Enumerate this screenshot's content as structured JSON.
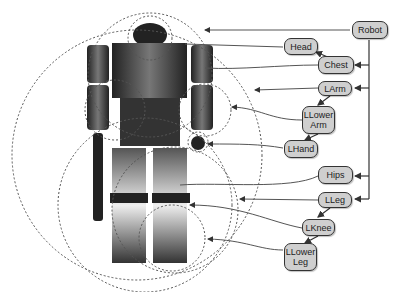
{
  "diagram": {
    "nodes": [
      {
        "id": "robot",
        "label": "Robot"
      },
      {
        "id": "head",
        "label": "Head"
      },
      {
        "id": "chest",
        "label": "Chest"
      },
      {
        "id": "larm",
        "label": "LArm"
      },
      {
        "id": "llowerarm",
        "label": "LLower Arm"
      },
      {
        "id": "lhand",
        "label": "LHand"
      },
      {
        "id": "hips",
        "label": "Hips"
      },
      {
        "id": "lleg",
        "label": "LLeg"
      },
      {
        "id": "lknee",
        "label": "LKnee"
      },
      {
        "id": "llowerleg",
        "label": "LLower Leg"
      }
    ],
    "edges": [
      {
        "from": "robot",
        "to": "chest"
      },
      {
        "from": "robot",
        "to": "larm"
      },
      {
        "from": "robot",
        "to": "hips"
      },
      {
        "from": "robot",
        "to": "lleg"
      },
      {
        "from": "chest",
        "to": "head"
      },
      {
        "from": "larm",
        "to": "llowerarm"
      },
      {
        "from": "llowerarm",
        "to": "lhand"
      },
      {
        "from": "lleg",
        "to": "lknee"
      },
      {
        "from": "lknee",
        "to": "llowerleg"
      }
    ],
    "image_label": "robot figure with dashed bounding spheres"
  }
}
